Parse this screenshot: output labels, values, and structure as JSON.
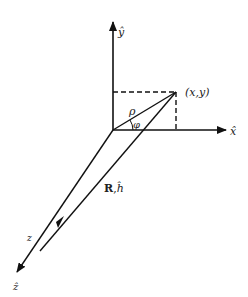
{
  "diagram": {
    "type": "coordinate-geometry",
    "labels": {
      "y_axis": "ŷ",
      "x_axis": "x̂",
      "z_axis": "ẑ",
      "point": "(x,y)",
      "rho": "ρ",
      "phi": "φ",
      "vector_R": "R",
      "vector_sep": ",",
      "vector_h": "ĥ",
      "z_point": "z"
    },
    "colors": {
      "line": "#111111",
      "background": "#ffffff"
    }
  }
}
